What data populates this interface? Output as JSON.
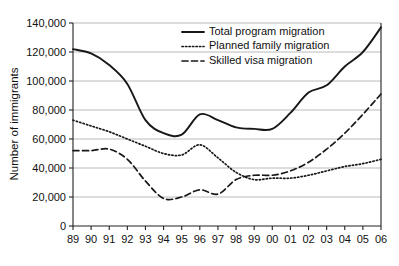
{
  "chart_data": {
    "type": "line",
    "title": "",
    "xlabel": "",
    "ylabel": "Number of immigrants",
    "x": [
      "89",
      "90",
      "91",
      "92",
      "93",
      "94",
      "95",
      "96",
      "97",
      "98",
      "99",
      "00",
      "01",
      "02",
      "03",
      "04",
      "05",
      "06"
    ],
    "categories": [
      "89",
      "90",
      "91",
      "92",
      "93",
      "94",
      "95",
      "96",
      "97",
      "98",
      "99",
      "00",
      "01",
      "02",
      "03",
      "04",
      "05",
      "06"
    ],
    "xlim": [
      0,
      17
    ],
    "ylim": [
      0,
      140000
    ],
    "ytick_labels": [
      "0",
      "20,000",
      "40,000",
      "60,000",
      "80,000",
      "100,000",
      "120,000",
      "140,000"
    ],
    "ytick_values": [
      0,
      20000,
      40000,
      60000,
      80000,
      100000,
      120000,
      140000
    ],
    "grid": true,
    "grid_axis": "y",
    "legend_position": "top-right",
    "series": [
      {
        "name": "Total program migration",
        "style": "solid",
        "color": "#181818",
        "values": [
          122000,
          119000,
          111000,
          98000,
          73000,
          64000,
          63000,
          77000,
          73000,
          68000,
          67000,
          67000,
          78000,
          92000,
          97000,
          110000,
          120000,
          137000
        ]
      },
      {
        "name": "Planned family migration",
        "style": "dotted",
        "color": "#181818",
        "values": [
          73000,
          69000,
          65000,
          60000,
          55000,
          50000,
          49000,
          56000,
          47000,
          37000,
          32000,
          33000,
          33000,
          35000,
          38000,
          41000,
          43000,
          46000
        ]
      },
      {
        "name": "Skilled visa migration",
        "style": "dashed",
        "color": "#181818",
        "values": [
          52000,
          52000,
          53000,
          46000,
          31000,
          19000,
          20000,
          25000,
          22000,
          32000,
          35000,
          35000,
          38000,
          44000,
          53000,
          64000,
          77000,
          91000
        ]
      }
    ]
  },
  "legend": {
    "items": [
      {
        "label": "Total program migration",
        "style": "solid"
      },
      {
        "label": "Planned family migration",
        "style": "dotted"
      },
      {
        "label": "Skilled visa migration",
        "style": "dashed"
      }
    ]
  },
  "axes": {
    "y_title": "Number of immigrants"
  }
}
